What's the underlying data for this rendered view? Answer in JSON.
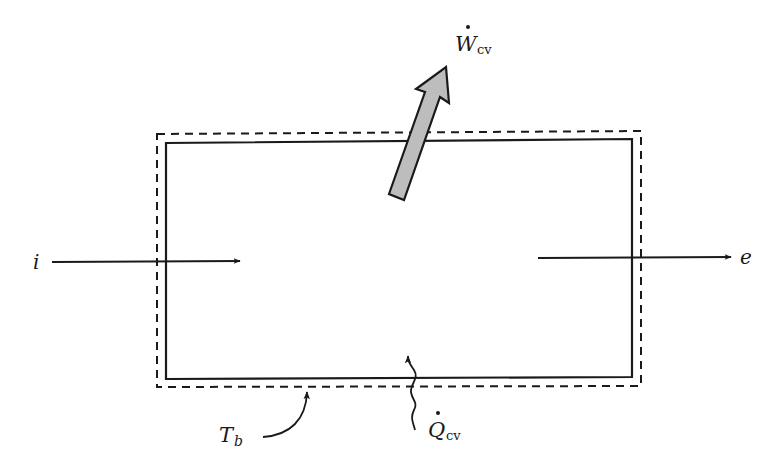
{
  "diagram": {
    "type": "control-volume schematic",
    "labels": {
      "inlet": "i",
      "outlet": "e",
      "work_symbol": "W",
      "work_subscript": "cv",
      "heat_symbol": "Q",
      "heat_subscript": "cv",
      "boundary_temp_symbol": "T",
      "boundary_temp_subscript": "b"
    },
    "colors": {
      "line": "#1a1a1a",
      "work_arrow_fill": "#bdbdbd",
      "background": "#ffffff"
    }
  }
}
